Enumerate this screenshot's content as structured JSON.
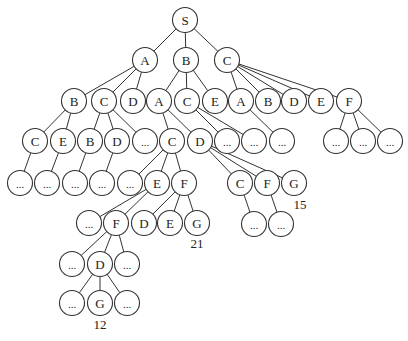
{
  "diagram": {
    "type": "search-tree",
    "root": "S",
    "node_radius": 12.5,
    "nodes": [
      {
        "id": "S",
        "label": "S",
        "x": 185,
        "y": 20
      },
      {
        "id": "n1a",
        "label": "A",
        "x": 145,
        "y": 60
      },
      {
        "id": "n1b",
        "label": "B",
        "x": 186,
        "y": 60
      },
      {
        "id": "n1c",
        "label": "C",
        "x": 227,
        "y": 60
      },
      {
        "id": "n2a",
        "label": "B",
        "x": 74,
        "y": 101
      },
      {
        "id": "n2b",
        "label": "C",
        "x": 104,
        "y": 101
      },
      {
        "id": "n2c",
        "label": "D",
        "x": 133,
        "y": 101
      },
      {
        "id": "n2d",
        "label": "A",
        "x": 159,
        "y": 101
      },
      {
        "id": "n2e",
        "label": "C",
        "x": 187,
        "y": 101
      },
      {
        "id": "n2f",
        "label": "E",
        "x": 215,
        "y": 101
      },
      {
        "id": "n2g",
        "label": "A",
        "x": 241,
        "y": 101
      },
      {
        "id": "n2h",
        "label": "B",
        "x": 268,
        "y": 101
      },
      {
        "id": "n2i",
        "label": "D",
        "x": 294,
        "y": 101
      },
      {
        "id": "n2j",
        "label": "E",
        "x": 321,
        "y": 101
      },
      {
        "id": "n2k",
        "label": "F",
        "x": 349,
        "y": 101
      },
      {
        "id": "n3a",
        "label": "C",
        "x": 35,
        "y": 141
      },
      {
        "id": "n3b",
        "label": "E",
        "x": 63,
        "y": 141
      },
      {
        "id": "n3c",
        "label": "B",
        "x": 90,
        "y": 141
      },
      {
        "id": "n3d",
        "label": "D",
        "x": 117,
        "y": 141
      },
      {
        "id": "n3e",
        "label": "...",
        "x": 145,
        "y": 141
      },
      {
        "id": "n3f",
        "label": "C",
        "x": 172,
        "y": 141
      },
      {
        "id": "n3g",
        "label": "D",
        "x": 200,
        "y": 141
      },
      {
        "id": "n3h",
        "label": "...",
        "x": 227,
        "y": 141
      },
      {
        "id": "n3i",
        "label": "...",
        "x": 254,
        "y": 141
      },
      {
        "id": "n3j",
        "label": "...",
        "x": 282,
        "y": 141
      },
      {
        "id": "n3k",
        "label": "...",
        "x": 336,
        "y": 141
      },
      {
        "id": "n3l",
        "label": "...",
        "x": 363,
        "y": 141
      },
      {
        "id": "n3m",
        "label": "...",
        "x": 390,
        "y": 141
      },
      {
        "id": "n4a",
        "label": "...",
        "x": 20,
        "y": 183
      },
      {
        "id": "n4b",
        "label": "...",
        "x": 47,
        "y": 183
      },
      {
        "id": "n4c",
        "label": "...",
        "x": 75,
        "y": 183
      },
      {
        "id": "n4d",
        "label": "...",
        "x": 102,
        "y": 183
      },
      {
        "id": "n4e",
        "label": "...",
        "x": 130,
        "y": 183
      },
      {
        "id": "n4f",
        "label": "E",
        "x": 157,
        "y": 183
      },
      {
        "id": "n4g",
        "label": "F",
        "x": 184,
        "y": 183
      },
      {
        "id": "n4h",
        "label": "C",
        "x": 240,
        "y": 183
      },
      {
        "id": "n4i",
        "label": "F",
        "x": 267,
        "y": 183
      },
      {
        "id": "n4j",
        "label": "G",
        "x": 294,
        "y": 183
      },
      {
        "id": "n5a",
        "label": "...",
        "x": 89,
        "y": 223
      },
      {
        "id": "n5b",
        "label": "F",
        "x": 116,
        "y": 223
      },
      {
        "id": "n5c",
        "label": "D",
        "x": 144,
        "y": 223
      },
      {
        "id": "n5d",
        "label": "E",
        "x": 170,
        "y": 223
      },
      {
        "id": "n5e",
        "label": "G",
        "x": 197,
        "y": 223
      },
      {
        "id": "n5f",
        "label": "...",
        "x": 254,
        "y": 224
      },
      {
        "id": "n5g",
        "label": "...",
        "x": 281,
        "y": 224
      },
      {
        "id": "n6a",
        "label": "...",
        "x": 72,
        "y": 264
      },
      {
        "id": "n6b",
        "label": "D",
        "x": 100,
        "y": 264
      },
      {
        "id": "n6c",
        "label": "...",
        "x": 127,
        "y": 264
      },
      {
        "id": "n7a",
        "label": "...",
        "x": 72,
        "y": 303
      },
      {
        "id": "n7b",
        "label": "G",
        "x": 100,
        "y": 303
      },
      {
        "id": "n7c",
        "label": "...",
        "x": 127,
        "y": 303
      }
    ],
    "edges": [
      [
        "S",
        "n1a"
      ],
      [
        "S",
        "n1b"
      ],
      [
        "S",
        "n1c"
      ],
      [
        "n1a",
        "n2a"
      ],
      [
        "n1a",
        "n2b"
      ],
      [
        "n1a",
        "n2c"
      ],
      [
        "n1b",
        "n2d"
      ],
      [
        "n1b",
        "n2e"
      ],
      [
        "n1b",
        "n2f"
      ],
      [
        "n1c",
        "n2g"
      ],
      [
        "n1c",
        "n2h"
      ],
      [
        "n1c",
        "n2i"
      ],
      [
        "n1c",
        "n2j"
      ],
      [
        "n1c",
        "n2k"
      ],
      [
        "n2a",
        "n3a"
      ],
      [
        "n2a",
        "n3b"
      ],
      [
        "n2b",
        "n3c"
      ],
      [
        "n2b",
        "n3d"
      ],
      [
        "n2b",
        "n3e"
      ],
      [
        "n2d",
        "n3f"
      ],
      [
        "n2d",
        "n3g"
      ],
      [
        "n2e",
        "n3h"
      ],
      [
        "n2e",
        "n3i"
      ],
      [
        "n2g",
        "n3j"
      ],
      [
        "n2k",
        "n3k"
      ],
      [
        "n2k",
        "n3l"
      ],
      [
        "n2k",
        "n3m"
      ],
      [
        "n3a",
        "n4a"
      ],
      [
        "n3b",
        "n4b"
      ],
      [
        "n3c",
        "n4c"
      ],
      [
        "n3d",
        "n4d"
      ],
      [
        "n3f",
        "n4e"
      ],
      [
        "n3f",
        "n4f"
      ],
      [
        "n3f",
        "n4g"
      ],
      [
        "n3g",
        "n4h"
      ],
      [
        "n3g",
        "n4i"
      ],
      [
        "n3g",
        "n4j"
      ],
      [
        "n4f",
        "n5a"
      ],
      [
        "n4f",
        "n5b"
      ],
      [
        "n4g",
        "n5c"
      ],
      [
        "n4g",
        "n5d"
      ],
      [
        "n4g",
        "n5e"
      ],
      [
        "n4h",
        "n5f"
      ],
      [
        "n4i",
        "n5g"
      ],
      [
        "n5b",
        "n6a"
      ],
      [
        "n5b",
        "n6b"
      ],
      [
        "n5b",
        "n6c"
      ],
      [
        "n6b",
        "n7a"
      ],
      [
        "n6b",
        "n7b"
      ],
      [
        "n6b",
        "n7c"
      ]
    ],
    "goal_costs": [
      {
        "node": "n4j",
        "label": "15",
        "x": 300,
        "y": 209
      },
      {
        "node": "n5e",
        "label": "21",
        "x": 197,
        "y": 248
      },
      {
        "node": "n7b",
        "label": "12",
        "x": 100,
        "y": 329
      }
    ]
  }
}
